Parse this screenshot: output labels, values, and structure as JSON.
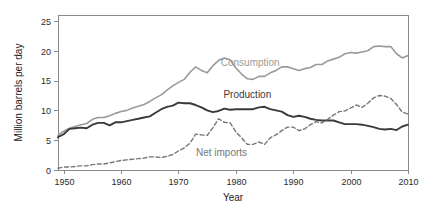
{
  "chart_data": {
    "type": "line",
    "title": "",
    "subtitle": "",
    "xlabel": "Year",
    "ylabel": "Million barrels per day",
    "xlim": [
      1949,
      2010
    ],
    "ylim": [
      0,
      26
    ],
    "xticks": [
      1950,
      1960,
      1970,
      1980,
      1990,
      2000,
      2010
    ],
    "yticks": [
      0,
      5,
      10,
      15,
      20,
      25
    ],
    "xtick_labels": [
      "1950",
      "1960",
      "1970",
      "1980",
      "1990",
      "2000",
      "2010"
    ],
    "ytick_labels": [
      "0",
      "5",
      "10",
      "15",
      "20",
      "25"
    ],
    "grid": false,
    "legend_position": "inline-annotation",
    "annotations": [
      {
        "text": "Consumption",
        "x": 1982.5,
        "y": 17.4,
        "color": "#9a9a9a"
      },
      {
        "text": "Production",
        "x": 1982.0,
        "y": 12.1,
        "color": "#3a3a3a"
      },
      {
        "text": "Net imports",
        "x": 1977.5,
        "y": 2.35,
        "color": "#777777"
      }
    ],
    "x": [
      1949,
      1950,
      1951,
      1952,
      1953,
      1954,
      1955,
      1956,
      1957,
      1958,
      1959,
      1960,
      1961,
      1962,
      1963,
      1964,
      1965,
      1966,
      1967,
      1968,
      1969,
      1970,
      1971,
      1972,
      1973,
      1974,
      1975,
      1976,
      1977,
      1978,
      1979,
      1980,
      1981,
      1982,
      1983,
      1984,
      1985,
      1986,
      1987,
      1988,
      1989,
      1990,
      1991,
      1992,
      1993,
      1994,
      1995,
      1996,
      1997,
      1998,
      1999,
      2000,
      2001,
      2002,
      2003,
      2004,
      2005,
      2006,
      2007,
      2008,
      2009,
      2010
    ],
    "series": [
      {
        "name": "Consumption",
        "color": "#9a9a9a",
        "style": "solid",
        "width": 1.6,
        "values": [
          5.8,
          6.5,
          7.0,
          7.3,
          7.6,
          7.8,
          8.5,
          8.8,
          8.8,
          9.1,
          9.5,
          9.8,
          10.0,
          10.4,
          10.7,
          11.0,
          11.5,
          12.1,
          12.6,
          13.4,
          14.1,
          14.7,
          15.2,
          16.4,
          17.3,
          16.7,
          16.3,
          17.5,
          18.4,
          18.8,
          18.5,
          17.1,
          16.1,
          15.3,
          15.2,
          15.7,
          15.7,
          16.3,
          16.7,
          17.3,
          17.3,
          17.0,
          16.7,
          17.0,
          17.2,
          17.7,
          17.7,
          18.3,
          18.6,
          18.9,
          19.5,
          19.7,
          19.6,
          19.8,
          20.0,
          20.7,
          20.8,
          20.7,
          20.7,
          19.5,
          18.8,
          19.2
        ]
      },
      {
        "name": "Production",
        "color": "#3a3a3a",
        "style": "solid",
        "width": 1.9,
        "values": [
          5.5,
          6.0,
          6.9,
          7.0,
          7.1,
          7.0,
          7.6,
          7.9,
          7.9,
          7.5,
          8.0,
          8.0,
          8.2,
          8.4,
          8.6,
          8.8,
          9.0,
          9.6,
          10.2,
          10.6,
          10.8,
          11.3,
          11.2,
          11.2,
          10.9,
          10.5,
          10.0,
          9.7,
          9.9,
          10.3,
          10.1,
          10.2,
          10.2,
          10.2,
          10.2,
          10.5,
          10.6,
          10.2,
          10.0,
          9.8,
          9.2,
          8.9,
          9.1,
          8.9,
          8.6,
          8.4,
          8.3,
          8.3,
          8.3,
          8.0,
          7.7,
          7.7,
          7.7,
          7.6,
          7.4,
          7.2,
          6.9,
          6.8,
          6.9,
          6.7,
          7.3,
          7.6
        ]
      },
      {
        "name": "Net imports",
        "color": "#777777",
        "style": "dashed",
        "width": 1.4,
        "values": [
          0.3,
          0.5,
          0.5,
          0.6,
          0.7,
          0.7,
          0.9,
          1.0,
          1.0,
          1.2,
          1.4,
          1.6,
          1.7,
          1.8,
          1.9,
          2.0,
          2.2,
          2.2,
          2.1,
          2.3,
          2.6,
          3.2,
          3.7,
          4.5,
          6.0,
          5.9,
          5.8,
          7.1,
          8.6,
          8.0,
          7.9,
          6.4,
          5.4,
          4.3,
          4.3,
          4.7,
          4.3,
          5.4,
          5.9,
          6.6,
          7.2,
          7.2,
          6.6,
          6.9,
          7.6,
          8.1,
          7.9,
          8.5,
          9.2,
          9.8,
          9.9,
          10.4,
          10.9,
          10.5,
          11.2,
          12.1,
          12.5,
          12.4,
          12.0,
          11.0,
          9.7,
          9.4
        ]
      }
    ]
  }
}
